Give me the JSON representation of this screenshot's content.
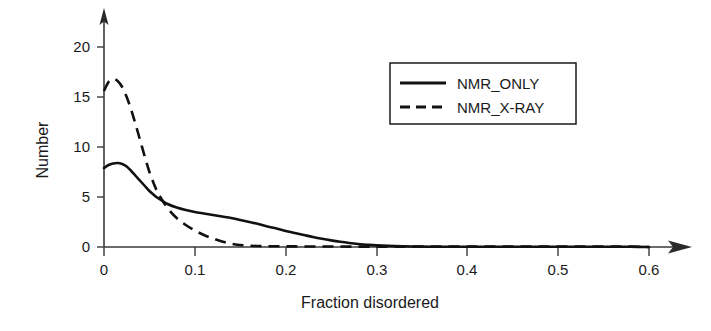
{
  "chart_data": {
    "type": "line",
    "title": "",
    "xlabel": "Fraction disordered",
    "ylabel": "Number",
    "xlim": [
      0,
      0.6
    ],
    "ylim": [
      0,
      21
    ],
    "grid": false,
    "legend_position": "top-right",
    "xticks": [
      "0",
      "0.1",
      "0.2",
      "0.3",
      "0.4",
      "0.5",
      "0.6"
    ],
    "xtick_values": [
      0,
      0.1,
      0.2,
      0.3,
      0.4,
      0.5,
      0.6
    ],
    "yticks": [
      "0",
      "5",
      "10",
      "15",
      "20"
    ],
    "ytick_values": [
      0,
      5,
      10,
      15,
      20
    ],
    "x": [
      0.0,
      0.005,
      0.01,
      0.015,
      0.02,
      0.025,
      0.03,
      0.035,
      0.04,
      0.045,
      0.05,
      0.055,
      0.06,
      0.07,
      0.08,
      0.09,
      0.1,
      0.11,
      0.12,
      0.13,
      0.14,
      0.15,
      0.16,
      0.17,
      0.18,
      0.19,
      0.2,
      0.21,
      0.22,
      0.23,
      0.24,
      0.25,
      0.26,
      0.27,
      0.28,
      0.29,
      0.3,
      0.32,
      0.34,
      0.36,
      0.38,
      0.4,
      0.42,
      0.44,
      0.46,
      0.48,
      0.5,
      0.52,
      0.54,
      0.56,
      0.58,
      0.6
    ],
    "series": [
      {
        "name": "NMR_ONLY",
        "style": "solid",
        "color": "#111111",
        "peak_x": 0.015,
        "peak_y": 8.4,
        "values": [
          7.9,
          8.2,
          8.35,
          8.4,
          8.3,
          8.05,
          7.6,
          7.1,
          6.6,
          6.1,
          5.6,
          5.2,
          4.85,
          4.3,
          3.95,
          3.7,
          3.5,
          3.35,
          3.2,
          3.05,
          2.9,
          2.7,
          2.5,
          2.3,
          2.05,
          1.85,
          1.6,
          1.4,
          1.2,
          1.0,
          0.82,
          0.66,
          0.52,
          0.4,
          0.3,
          0.22,
          0.16,
          0.09,
          0.05,
          0.03,
          0.02,
          0.02,
          0.02,
          0.02,
          0.02,
          0.02,
          0.02,
          0.02,
          0.02,
          0.02,
          0.02,
          0.0
        ]
      },
      {
        "name": "NMR_X-RAY",
        "style": "dashed",
        "color": "#111111",
        "peak_x": 0.01,
        "peak_y": 16.8,
        "values": [
          15.6,
          16.5,
          16.8,
          16.6,
          16.0,
          15.0,
          13.7,
          12.2,
          10.6,
          9.0,
          7.5,
          6.3,
          5.3,
          3.9,
          2.9,
          2.2,
          1.65,
          1.2,
          0.85,
          0.55,
          0.32,
          0.2,
          0.13,
          0.1,
          0.08,
          0.07,
          0.06,
          0.06,
          0.05,
          0.05,
          0.05,
          0.05,
          0.05,
          0.04,
          0.04,
          0.04,
          0.04,
          0.04,
          0.04,
          0.04,
          0.04,
          0.04,
          0.04,
          0.04,
          0.04,
          0.04,
          0.04,
          0.04,
          0.04,
          0.04,
          0.04,
          0.0
        ]
      }
    ],
    "annotations": {
      "crossing_point": {
        "x": 0.048,
        "y": 5.1
      }
    }
  },
  "legend": {
    "entries": [
      {
        "label": "NMR_ONLY",
        "style": "solid"
      },
      {
        "label": "NMR_X-RAY",
        "style": "dashed"
      }
    ]
  },
  "axes": {
    "x_title": "Fraction disordered",
    "y_title": "Number",
    "x_tick_labels": [
      "0",
      "0.1",
      "0.2",
      "0.3",
      "0.4",
      "0.5",
      "0.6"
    ],
    "y_tick_labels": [
      "0",
      "5",
      "10",
      "15",
      "20"
    ]
  },
  "colors": {
    "background": "#ffffff",
    "line": "#111111",
    "axis": "#3a3a3a",
    "text": "#1a1a1a"
  }
}
